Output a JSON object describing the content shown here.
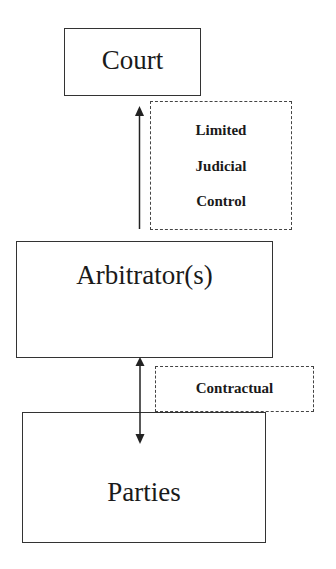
{
  "diagram": {
    "nodes": {
      "court": {
        "label": "Court"
      },
      "arbitrators": {
        "label": "Arbitrator(s)"
      },
      "parties": {
        "label": "Parties"
      }
    },
    "relations": {
      "judicial_control": {
        "lines": [
          "Limited",
          "Judicial",
          "Control"
        ],
        "from": "Arbitrator(s)",
        "to": "Court",
        "direction": "up"
      },
      "contractual": {
        "label": "Contractual",
        "between": [
          "Arbitrator(s)",
          "Parties"
        ],
        "direction": "bidirectional"
      }
    },
    "colors": {
      "stroke": "#333333",
      "background": "#ffffff"
    }
  }
}
